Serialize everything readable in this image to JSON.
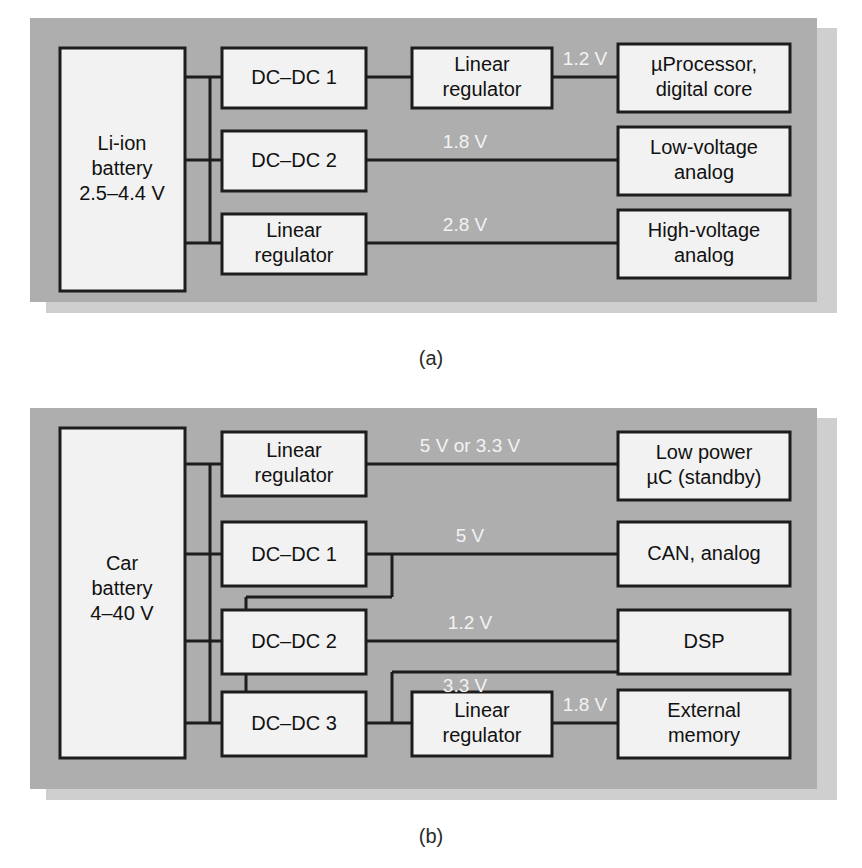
{
  "figure": {
    "background_color": "#ffffff",
    "panel_color": "#aeaeae",
    "panel_shadow_color": "#cfcfcf",
    "box_fill_color": "#f2f2f2",
    "line_color": "#1d1d1d",
    "voltage_label_color": "#f3f3f3"
  },
  "panels": [
    {
      "id": "panel-a",
      "caption": "(a)",
      "source": {
        "line1": "Li-ion",
        "line2": "battery",
        "line3": "2.5–4.4 V"
      },
      "converters": [
        {
          "id": "a-dcdc1",
          "line1": "DC–DC 1",
          "line2": ""
        },
        {
          "id": "a-dcdc2",
          "line1": "DC–DC 2",
          "line2": ""
        },
        {
          "id": "a-linreg",
          "line1": "Linear",
          "line2": "regulator"
        }
      ],
      "stage2": [
        {
          "id": "a-linreg2",
          "line1": "Linear",
          "line2": "regulator"
        }
      ],
      "loads": [
        {
          "id": "a-load1",
          "line1": "µProcessor,",
          "line2": "digital core"
        },
        {
          "id": "a-load2",
          "line1": "Low-voltage",
          "line2": "analog"
        },
        {
          "id": "a-load3",
          "line1": "High-voltage",
          "line2": "analog"
        }
      ],
      "rails": [
        {
          "id": "a-rail-1v2",
          "label": "1.2 V"
        },
        {
          "id": "a-rail-1v8",
          "label": "1.8 V"
        },
        {
          "id": "a-rail-2v8",
          "label": "2.8 V"
        }
      ]
    },
    {
      "id": "panel-b",
      "caption": "(b)",
      "source": {
        "line1": "Car",
        "line2": "battery",
        "line3": "4–40 V"
      },
      "converters": [
        {
          "id": "b-linreg",
          "line1": "Linear",
          "line2": "regulator"
        },
        {
          "id": "b-dcdc1",
          "line1": "DC–DC 1",
          "line2": ""
        },
        {
          "id": "b-dcdc2",
          "line1": "DC–DC 2",
          "line2": ""
        },
        {
          "id": "b-dcdc3",
          "line1": "DC–DC 3",
          "line2": ""
        }
      ],
      "stage2": [
        {
          "id": "b-linreg2",
          "line1": "Linear",
          "line2": "regulator"
        }
      ],
      "loads": [
        {
          "id": "b-load1",
          "line1": "Low power",
          "line2": "µC (standby)"
        },
        {
          "id": "b-load2",
          "line1": "CAN, analog",
          "line2": ""
        },
        {
          "id": "b-load3",
          "line1": "DSP",
          "line2": ""
        },
        {
          "id": "b-load4",
          "line1": "External",
          "line2": "memory"
        }
      ],
      "rails": [
        {
          "id": "b-rail-5v-3v3",
          "label": "5 V or 3.3 V"
        },
        {
          "id": "b-rail-5v",
          "label": "5 V"
        },
        {
          "id": "b-rail-1v2",
          "label": "1.2 V"
        },
        {
          "id": "b-rail-3v3",
          "label": "3.3 V"
        },
        {
          "id": "b-rail-1v8",
          "label": "1.8 V"
        }
      ]
    }
  ]
}
